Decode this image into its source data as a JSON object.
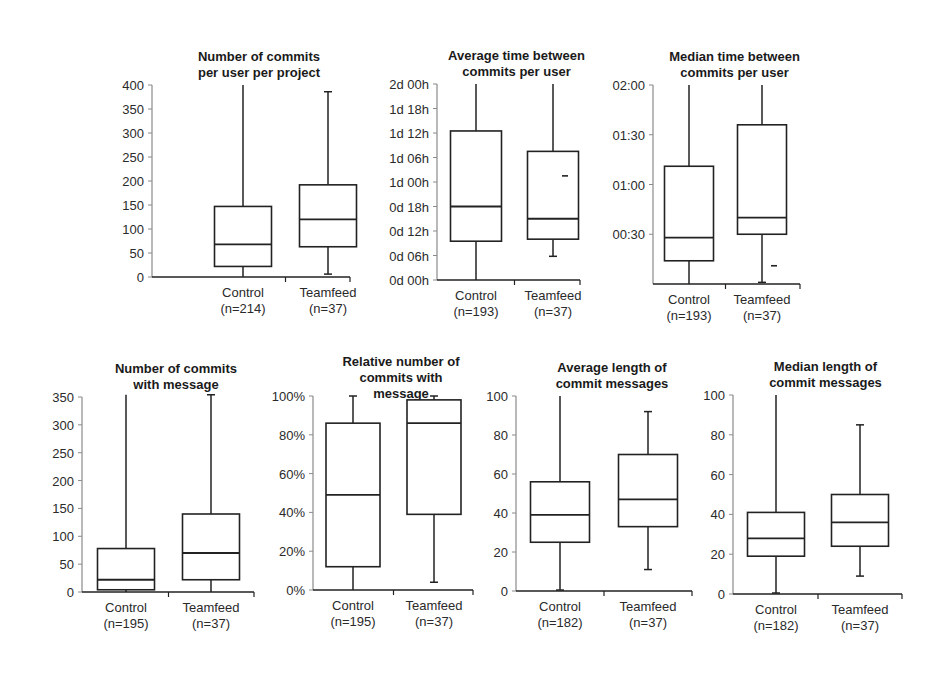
{
  "chart_data": [
    {
      "type": "box",
      "title": [
        "Number of commits",
        "per user per project"
      ],
      "xlabel": "",
      "ylabel": "",
      "ylim": [
        0,
        400
      ],
      "yticks": [
        0,
        50,
        100,
        150,
        200,
        250,
        300,
        350,
        400
      ],
      "ytick_labels": [
        "0",
        "50",
        "100",
        "150",
        "200",
        "250",
        "300",
        "350",
        "400"
      ],
      "categories": [
        {
          "name": "Control",
          "n": "(n=214)"
        },
        {
          "name": "Teamfeed",
          "n": "(n=37)"
        }
      ],
      "series": [
        {
          "name": "Control",
          "whisker_low": 0,
          "q1": 22,
          "median": 68,
          "q3": 147,
          "whisker_high": 400,
          "cap_high": false,
          "cap_low": false
        },
        {
          "name": "Teamfeed",
          "whisker_low": 6,
          "q1": 63,
          "median": 120,
          "q3": 192,
          "whisker_high": 386,
          "cap_high": true,
          "cap_low": true
        }
      ],
      "layout": {
        "axis_x": 152,
        "y_top": 85,
        "y_bottom": 277,
        "x_right": 350,
        "box_w": 57,
        "centers": [
          243,
          328
        ]
      }
    },
    {
      "type": "box",
      "title": [
        "Average time between",
        "commits per user"
      ],
      "xlabel": "",
      "ylabel": "",
      "ylim_hours": [
        0,
        48
      ],
      "yticks": [
        0,
        6,
        12,
        18,
        24,
        30,
        36,
        42,
        48
      ],
      "ytick_labels": [
        "0d 00h",
        "0d 06h",
        "0d 12h",
        "0d 18h",
        "1d 00h",
        "1d 06h",
        "1d 12h",
        "1d 18h",
        "2d 00h"
      ],
      "categories": [
        {
          "name": "Control",
          "n": "(n=193)"
        },
        {
          "name": "Teamfeed",
          "n": "(n=37)"
        }
      ],
      "series": [
        {
          "name": "Control",
          "whisker_low": 0,
          "q1": 9.5,
          "median": 18,
          "q3": 36.5,
          "whisker_high": 48,
          "cap_high": false,
          "cap_low": false
        },
        {
          "name": "Teamfeed",
          "whisker_low": 5.8,
          "q1": 10,
          "median": 15,
          "q3": 31.5,
          "whisker_high": 48,
          "cap_high": false,
          "cap_low": true,
          "marker": 25.5
        }
      ],
      "layout": {
        "axis_x": 437,
        "y_top": 84,
        "y_bottom": 280,
        "x_right": 580,
        "box_w": 51,
        "centers": [
          476,
          553
        ]
      }
    },
    {
      "type": "box",
      "title": [
        "Median time between",
        "commits per user"
      ],
      "xlabel": "",
      "ylabel": "",
      "ylim_minutes": [
        0,
        120
      ],
      "yticks": [
        30,
        60,
        90,
        120
      ],
      "ytick_labels": [
        "00:30",
        "01:00",
        "01:30",
        "02:00"
      ],
      "categories": [
        {
          "name": "Control",
          "n": "(n=193)"
        },
        {
          "name": "Teamfeed",
          "n": "(n=37)"
        }
      ],
      "series": [
        {
          "name": "Control",
          "whisker_low": 0,
          "q1": 14,
          "median": 28,
          "q3": 71,
          "whisker_high": 120,
          "cap_high": false,
          "cap_low": false
        },
        {
          "name": "Teamfeed",
          "whisker_low": 1,
          "q1": 30,
          "median": 40,
          "q3": 96,
          "whisker_high": 120,
          "cap_high": false,
          "cap_low": true,
          "marker": 11
        }
      ],
      "layout": {
        "axis_x": 653,
        "y_top": 85,
        "y_bottom": 284,
        "x_right": 800,
        "box_w": 49,
        "centers": [
          689,
          762
        ]
      }
    },
    {
      "type": "box",
      "title": [
        "Number of commits",
        "with message"
      ],
      "xlabel": "",
      "ylabel": "",
      "ylim": [
        0,
        350
      ],
      "yticks": [
        0,
        50,
        100,
        150,
        200,
        250,
        300,
        350
      ],
      "ytick_labels": [
        "0",
        "50",
        "100",
        "150",
        "200",
        "250",
        "300",
        "350"
      ],
      "categories": [
        {
          "name": "Control",
          "n": "(n=195)"
        },
        {
          "name": "Teamfeed",
          "n": "(n=37)"
        }
      ],
      "series": [
        {
          "name": "Control",
          "whisker_low": 0,
          "q1": 4,
          "median": 22,
          "q3": 78,
          "whisker_high": 354,
          "cap_high": false,
          "cap_low": false
        },
        {
          "name": "Teamfeed",
          "whisker_low": 0,
          "q1": 22,
          "median": 70,
          "q3": 140,
          "whisker_high": 354,
          "cap_high": true,
          "cap_low": false
        }
      ],
      "layout": {
        "axis_x": 82,
        "y_top": 397,
        "y_bottom": 592,
        "x_right": 254,
        "box_w": 57,
        "centers": [
          126,
          211
        ]
      }
    },
    {
      "type": "box",
      "title": [
        "Relative number of",
        "commits with",
        "message"
      ],
      "xlabel": "",
      "ylabel": "",
      "ylim": [
        0,
        100
      ],
      "yticks": [
        0,
        20,
        40,
        60,
        80,
        100
      ],
      "ytick_labels": [
        "0%",
        "20%",
        "40%",
        "60%",
        "80%",
        "100%"
      ],
      "categories": [
        {
          "name": "Control",
          "n": "(n=195)"
        },
        {
          "name": "Teamfeed",
          "n": "(n=37)"
        }
      ],
      "series": [
        {
          "name": "Control",
          "whisker_low": 0,
          "q1": 12,
          "median": 49,
          "q3": 86,
          "whisker_high": 100,
          "cap_high": true,
          "cap_low": false
        },
        {
          "name": "Teamfeed",
          "whisker_low": 4,
          "q1": 39,
          "median": 86,
          "q3": 98,
          "whisker_high": 100,
          "cap_high": true,
          "cap_low": true
        }
      ],
      "layout": {
        "axis_x": 313,
        "y_top": 396,
        "y_bottom": 590,
        "x_right": 473,
        "box_w": 54,
        "centers": [
          353,
          434
        ]
      }
    },
    {
      "type": "box",
      "title": [
        "Average length of",
        "commit messages"
      ],
      "xlabel": "",
      "ylabel": "",
      "ylim": [
        0,
        100
      ],
      "yticks": [
        0,
        20,
        40,
        60,
        80,
        100
      ],
      "ytick_labels": [
        "0",
        "20",
        "40",
        "60",
        "80",
        "100"
      ],
      "categories": [
        {
          "name": "Control",
          "n": "(n=182)"
        },
        {
          "name": "Teamfeed",
          "n": "(n=37)"
        }
      ],
      "series": [
        {
          "name": "Control",
          "whisker_low": 0.5,
          "q1": 25,
          "median": 39,
          "q3": 56,
          "whisker_high": 100,
          "cap_high": false,
          "cap_low": true
        },
        {
          "name": "Teamfeed",
          "whisker_low": 11,
          "q1": 33,
          "median": 47,
          "q3": 70,
          "whisker_high": 92,
          "cap_high": true,
          "cap_low": true
        }
      ],
      "layout": {
        "axis_x": 516,
        "y_top": 396,
        "y_bottom": 591,
        "x_right": 692,
        "box_w": 59,
        "centers": [
          560,
          648
        ]
      }
    },
    {
      "type": "box",
      "title": [
        "Median length of",
        "commit messages"
      ],
      "xlabel": "",
      "ylabel": "",
      "ylim": [
        0,
        100
      ],
      "yticks": [
        0,
        20,
        40,
        60,
        80,
        100
      ],
      "ytick_labels": [
        "0",
        "20",
        "40",
        "60",
        "80",
        "100"
      ],
      "categories": [
        {
          "name": "Control",
          "n": "(n=182)"
        },
        {
          "name": "Teamfeed",
          "n": "(n=37)"
        }
      ],
      "series": [
        {
          "name": "Control",
          "whisker_low": 0.5,
          "q1": 19,
          "median": 28,
          "q3": 41,
          "whisker_high": 100,
          "cap_high": false,
          "cap_low": true
        },
        {
          "name": "Teamfeed",
          "whisker_low": 9,
          "q1": 24,
          "median": 36,
          "q3": 50,
          "whisker_high": 85,
          "cap_high": true,
          "cap_low": true
        }
      ],
      "layout": {
        "axis_x": 733,
        "y_top": 395,
        "y_bottom": 594,
        "x_right": 902,
        "box_w": 57,
        "centers": [
          776,
          860
        ]
      }
    }
  ]
}
